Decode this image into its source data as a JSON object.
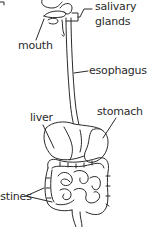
{
  "diagram": {
    "labels": {
      "salivary_line1": "salivary",
      "salivary_line2": "glands",
      "mouth": "mouth",
      "esophagus": "esophagus",
      "stomach": "stomach",
      "liver": "liver",
      "intestines": "intestines"
    },
    "colors": {
      "line": "#2a2a2a",
      "background": "#ffffff"
    }
  }
}
